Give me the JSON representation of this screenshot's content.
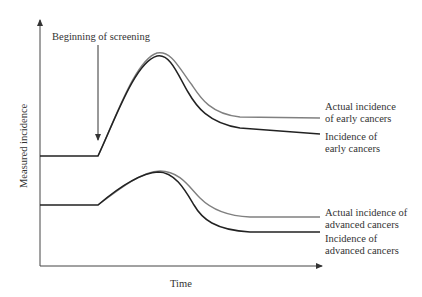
{
  "annotation": "Beginning of screening",
  "axes": {
    "xlabel": "Time",
    "ylabel": "Measured incidence"
  },
  "curves": {
    "early_actual": {
      "line1": "Actual incidence",
      "line2": "of early cancers",
      "color": "#808080"
    },
    "early_measured": {
      "line1": "Incidence of",
      "line2": "early cancers",
      "color": "#222222"
    },
    "advanced_actual": {
      "line1": "Actual incidence of",
      "line2": "advanced cancers",
      "color": "#808080"
    },
    "advanced_measured": {
      "line1": "Incidence of",
      "line2": "advanced cancers",
      "color": "#222222"
    }
  }
}
